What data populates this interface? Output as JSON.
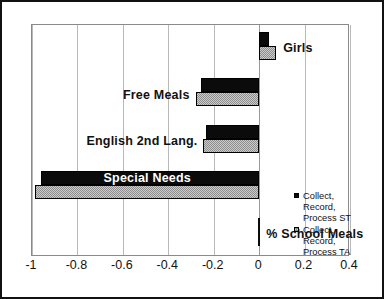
{
  "chart_data": {
    "type": "bar",
    "orientation": "horizontal",
    "title": "",
    "subtitle": "",
    "xlabel": "",
    "ylabel": "",
    "xlim": [
      -1,
      0.4
    ],
    "xticks": [
      -1,
      -0.8,
      -0.6,
      -0.4,
      -0.2,
      0,
      0.2,
      0.4
    ],
    "xtick_labels": [
      "-1",
      "-0.8",
      "-0.6",
      "-0.4",
      "-0.2",
      "0",
      "0.2",
      "0.4"
    ],
    "grid": true,
    "grid_axis": "x",
    "legend_position": "right-inside",
    "categories": [
      "Girls",
      "Free  Meals",
      "English 2nd Lang.",
      "Special  Needs",
      "% School  Meals"
    ],
    "series": [
      {
        "name": "Collect, Record, Process ST",
        "color": "#0b0b0b",
        "values": [
          0.045,
          -0.255,
          -0.233,
          -0.96,
          0.0
        ]
      },
      {
        "name": "Collect, Record, Process TA",
        "color": "#8d8d8d",
        "values": [
          0.075,
          -0.28,
          -0.245,
          -0.985,
          0.0
        ]
      }
    ],
    "annotations": []
  },
  "legend": {
    "entries": [
      {
        "swatch": "st",
        "line1": "Collect,",
        "line2": "Record,",
        "line3": "Process ST"
      },
      {
        "swatch": "ta",
        "line1": "Collect,",
        "line2": "Record,",
        "line3": "Process TA"
      }
    ]
  },
  "colors": {
    "series_st": "#0b0b0b",
    "series_ta": "#8d8d8d",
    "frame": "#111111",
    "plot_border": "#8a8a8a",
    "gridline": "#b9b9b9",
    "text": "#111111",
    "label_on_bar": "#ffffff",
    "background": "#ffffff"
  }
}
